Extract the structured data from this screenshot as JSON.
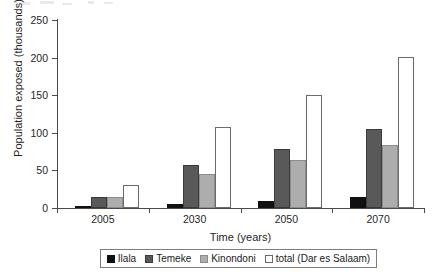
{
  "chart_data": {
    "type": "bar",
    "title": "",
    "xlabel": "Time (years)",
    "ylabel": "Population exposed (thousands)",
    "categories": [
      "2005",
      "2030",
      "2050",
      "2070"
    ],
    "ylim": [
      0,
      250
    ],
    "yticks": [
      0,
      50,
      100,
      150,
      200,
      250
    ],
    "ytick_labels": [
      "0",
      "50",
      "100",
      "150",
      "200",
      "250"
    ],
    "grid": false,
    "legend_position": "bottom",
    "series": [
      {
        "name": "Ilala",
        "color": "#101010",
        "values": [
          2,
          6,
          9,
          14
        ]
      },
      {
        "name": "Temeke",
        "color": "#595959",
        "values": [
          14,
          57,
          79,
          105
        ]
      },
      {
        "name": "Kinondoni",
        "color": "#adadad",
        "values": [
          15,
          45,
          64,
          84
        ]
      },
      {
        "name": "total (Dar es Salaam)",
        "color": "#ffffff",
        "values": [
          31,
          108,
          150,
          201
        ]
      }
    ]
  },
  "legend": {
    "items": [
      {
        "label": "Ilala",
        "swatch": "ilala"
      },
      {
        "label": "Temeke",
        "swatch": "temeke"
      },
      {
        "label": "Kinondoni",
        "swatch": "kinondoni"
      },
      {
        "label": "total (Dar es Salaam)",
        "swatch": "total"
      }
    ]
  }
}
